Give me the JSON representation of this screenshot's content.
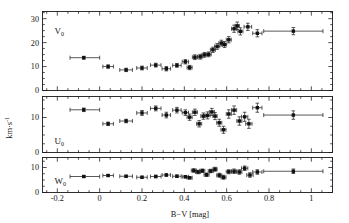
{
  "figure": {
    "width": 349,
    "height": 223,
    "background": "#ffffff",
    "ink_color": "#151515"
  },
  "axes": {
    "xlabel": "B−V [mag]",
    "ylabel": "km·s",
    "ylabel_exp": "-1",
    "x_ticklabels": [
      "-0.2",
      "0",
      "0.2",
      "0.4",
      "0.6",
      "0.8",
      "1"
    ],
    "x_tickvalues": [
      -0.2,
      0,
      0.2,
      0.4,
      0.6,
      0.8,
      1.0
    ],
    "xlim": [
      -0.27,
      1.1
    ],
    "x_minor_step": 0.05
  },
  "panels": [
    {
      "id": "panel-v",
      "label": "V",
      "label_sub": "0",
      "y_ticklabels": [
        "0",
        "10",
        "20",
        "30"
      ],
      "y_tickvalues": [
        0,
        10,
        20,
        30
      ],
      "ylim": [
        0,
        33
      ],
      "y_minor_step": 2.5
    },
    {
      "id": "panel-u",
      "label": "U",
      "label_sub": "0",
      "y_ticklabels": [
        "0",
        "10"
      ],
      "y_tickvalues": [
        0,
        10
      ],
      "ylim": [
        0,
        16
      ],
      "y_minor_step": 2.5
    },
    {
      "id": "panel-w",
      "label": "W",
      "label_sub": "0",
      "y_ticklabels": [
        "0",
        "10"
      ],
      "y_tickvalues": [
        0,
        10
      ],
      "ylim": [
        0,
        14
      ],
      "y_minor_step": 2.5
    }
  ],
  "chart_data": [
    {
      "type": "scatter",
      "title": "V0 velocity dispersion vs B-V",
      "panel": "panel-v",
      "xlabel": "B−V [mag]",
      "ylabel": "km·s^-1",
      "series_name": "V0",
      "xlim": [
        -0.27,
        1.1
      ],
      "ylim": [
        0,
        33
      ],
      "grid": false,
      "legend": "none",
      "points": [
        {
          "x": -0.075,
          "y": 13.7,
          "xerr_lo": 0.065,
          "xerr_hi": 0.075,
          "yerr": 0.6
        },
        {
          "x": 0.04,
          "y": 10.0,
          "xerr_lo": 0.025,
          "xerr_hi": 0.025,
          "yerr": 0.7
        },
        {
          "x": 0.125,
          "y": 8.6,
          "xerr_lo": 0.03,
          "xerr_hi": 0.03,
          "yerr": 0.7
        },
        {
          "x": 0.2,
          "y": 9.4,
          "xerr_lo": 0.025,
          "xerr_hi": 0.025,
          "yerr": 0.8
        },
        {
          "x": 0.265,
          "y": 10.6,
          "xerr_lo": 0.025,
          "xerr_hi": 0.025,
          "yerr": 0.8
        },
        {
          "x": 0.315,
          "y": 9.1,
          "xerr_lo": 0.02,
          "xerr_hi": 0.02,
          "yerr": 0.9
        },
        {
          "x": 0.365,
          "y": 10.5,
          "xerr_lo": 0.02,
          "xerr_hi": 0.02,
          "yerr": 0.8
        },
        {
          "x": 0.405,
          "y": 12.0,
          "xerr_lo": 0.015,
          "xerr_hi": 0.015,
          "yerr": 0.9
        },
        {
          "x": 0.425,
          "y": 9.6,
          "xerr_lo": 0.012,
          "xerr_hi": 0.012,
          "yerr": 0.9
        },
        {
          "x": 0.45,
          "y": 13.9,
          "xerr_lo": 0.012,
          "xerr_hi": 0.012,
          "yerr": 1.0
        },
        {
          "x": 0.475,
          "y": 14.1,
          "xerr_lo": 0.012,
          "xerr_hi": 0.012,
          "yerr": 1.0
        },
        {
          "x": 0.495,
          "y": 14.9,
          "xerr_lo": 0.012,
          "xerr_hi": 0.012,
          "yerr": 1.0
        },
        {
          "x": 0.515,
          "y": 15.1,
          "xerr_lo": 0.012,
          "xerr_hi": 0.012,
          "yerr": 1.0
        },
        {
          "x": 0.535,
          "y": 17.0,
          "xerr_lo": 0.012,
          "xerr_hi": 0.012,
          "yerr": 1.1
        },
        {
          "x": 0.555,
          "y": 18.4,
          "xerr_lo": 0.012,
          "xerr_hi": 0.012,
          "yerr": 1.2
        },
        {
          "x": 0.575,
          "y": 19.8,
          "xerr_lo": 0.012,
          "xerr_hi": 0.012,
          "yerr": 1.2
        },
        {
          "x": 0.59,
          "y": 19.2,
          "xerr_lo": 0.01,
          "xerr_hi": 0.01,
          "yerr": 1.2
        },
        {
          "x": 0.61,
          "y": 21.2,
          "xerr_lo": 0.012,
          "xerr_hi": 0.012,
          "yerr": 1.3
        },
        {
          "x": 0.635,
          "y": 25.8,
          "xerr_lo": 0.012,
          "xerr_hi": 0.012,
          "yerr": 1.5
        },
        {
          "x": 0.65,
          "y": 27.0,
          "xerr_lo": 0.01,
          "xerr_hi": 0.01,
          "yerr": 1.6
        },
        {
          "x": 0.665,
          "y": 24.7,
          "xerr_lo": 0.012,
          "xerr_hi": 0.012,
          "yerr": 1.5
        },
        {
          "x": 0.7,
          "y": 26.6,
          "xerr_lo": 0.018,
          "xerr_hi": 0.018,
          "yerr": 1.5
        },
        {
          "x": 0.745,
          "y": 23.9,
          "xerr_lo": 0.022,
          "xerr_hi": 0.022,
          "yerr": 1.5
        },
        {
          "x": 0.915,
          "y": 24.8,
          "xerr_lo": 0.14,
          "xerr_hi": 0.14,
          "yerr": 1.5
        }
      ]
    },
    {
      "type": "scatter",
      "title": "U0 velocity dispersion vs B-V",
      "panel": "panel-u",
      "xlabel": "B−V [mag]",
      "ylabel": "km·s^-1",
      "series_name": "U0",
      "xlim": [
        -0.27,
        1.1
      ],
      "ylim": [
        0,
        16
      ],
      "grid": false,
      "legend": "none",
      "points": [
        {
          "x": -0.075,
          "y": 12.2,
          "xerr_lo": 0.065,
          "xerr_hi": 0.075,
          "yerr": 0.5
        },
        {
          "x": 0.04,
          "y": 8.2,
          "xerr_lo": 0.025,
          "xerr_hi": 0.025,
          "yerr": 0.5
        },
        {
          "x": 0.125,
          "y": 9.0,
          "xerr_lo": 0.03,
          "xerr_hi": 0.03,
          "yerr": 0.5
        },
        {
          "x": 0.2,
          "y": 11.3,
          "xerr_lo": 0.025,
          "xerr_hi": 0.025,
          "yerr": 0.7
        },
        {
          "x": 0.265,
          "y": 12.6,
          "xerr_lo": 0.025,
          "xerr_hi": 0.025,
          "yerr": 0.7
        },
        {
          "x": 0.315,
          "y": 10.7,
          "xerr_lo": 0.02,
          "xerr_hi": 0.02,
          "yerr": 0.8
        },
        {
          "x": 0.365,
          "y": 12.1,
          "xerr_lo": 0.02,
          "xerr_hi": 0.02,
          "yerr": 0.8
        },
        {
          "x": 0.405,
          "y": 11.4,
          "xerr_lo": 0.015,
          "xerr_hi": 0.015,
          "yerr": 0.8
        },
        {
          "x": 0.425,
          "y": 10.1,
          "xerr_lo": 0.012,
          "xerr_hi": 0.012,
          "yerr": 0.9
        },
        {
          "x": 0.45,
          "y": 11.5,
          "xerr_lo": 0.012,
          "xerr_hi": 0.012,
          "yerr": 0.9
        },
        {
          "x": 0.47,
          "y": 8.2,
          "xerr_lo": 0.012,
          "xerr_hi": 0.012,
          "yerr": 0.9
        },
        {
          "x": 0.49,
          "y": 10.4,
          "xerr_lo": 0.012,
          "xerr_hi": 0.012,
          "yerr": 0.9
        },
        {
          "x": 0.51,
          "y": 10.6,
          "xerr_lo": 0.012,
          "xerr_hi": 0.012,
          "yerr": 1.0
        },
        {
          "x": 0.53,
          "y": 11.6,
          "xerr_lo": 0.012,
          "xerr_hi": 0.012,
          "yerr": 1.0
        },
        {
          "x": 0.545,
          "y": 10.4,
          "xerr_lo": 0.01,
          "xerr_hi": 0.01,
          "yerr": 1.0
        },
        {
          "x": 0.565,
          "y": 8.5,
          "xerr_lo": 0.012,
          "xerr_hi": 0.012,
          "yerr": 1.0
        },
        {
          "x": 0.585,
          "y": 6.5,
          "xerr_lo": 0.012,
          "xerr_hi": 0.012,
          "yerr": 1.0
        },
        {
          "x": 0.61,
          "y": 11.0,
          "xerr_lo": 0.012,
          "xerr_hi": 0.012,
          "yerr": 1.2
        },
        {
          "x": 0.635,
          "y": 12.1,
          "xerr_lo": 0.012,
          "xerr_hi": 0.012,
          "yerr": 1.2
        },
        {
          "x": 0.66,
          "y": 9.0,
          "xerr_lo": 0.012,
          "xerr_hi": 0.012,
          "yerr": 1.2
        },
        {
          "x": 0.685,
          "y": 10.2,
          "xerr_lo": 0.015,
          "xerr_hi": 0.015,
          "yerr": 1.3
        },
        {
          "x": 0.705,
          "y": 8.2,
          "xerr_lo": 0.015,
          "xerr_hi": 0.015,
          "yerr": 1.3
        },
        {
          "x": 0.745,
          "y": 12.8,
          "xerr_lo": 0.022,
          "xerr_hi": 0.022,
          "yerr": 1.3
        },
        {
          "x": 0.915,
          "y": 10.7,
          "xerr_lo": 0.14,
          "xerr_hi": 0.14,
          "yerr": 1.2
        }
      ]
    },
    {
      "type": "scatter",
      "title": "W0 velocity dispersion vs B-V",
      "panel": "panel-w",
      "xlabel": "B−V [mag]",
      "ylabel": "km·s^-1",
      "series_name": "W0",
      "xlim": [
        -0.27,
        1.1
      ],
      "ylim": [
        0,
        14
      ],
      "grid": false,
      "legend": "none",
      "points": [
        {
          "x": -0.075,
          "y": 6.4,
          "xerr_lo": 0.065,
          "xerr_hi": 0.075,
          "yerr": 0.4
        },
        {
          "x": 0.04,
          "y": 6.8,
          "xerr_lo": 0.025,
          "xerr_hi": 0.025,
          "yerr": 0.4
        },
        {
          "x": 0.125,
          "y": 6.5,
          "xerr_lo": 0.03,
          "xerr_hi": 0.03,
          "yerr": 0.4
        },
        {
          "x": 0.2,
          "y": 6.1,
          "xerr_lo": 0.025,
          "xerr_hi": 0.025,
          "yerr": 0.4
        },
        {
          "x": 0.265,
          "y": 6.4,
          "xerr_lo": 0.025,
          "xerr_hi": 0.025,
          "yerr": 0.5
        },
        {
          "x": 0.315,
          "y": 7.0,
          "xerr_lo": 0.02,
          "xerr_hi": 0.02,
          "yerr": 0.5
        },
        {
          "x": 0.365,
          "y": 6.5,
          "xerr_lo": 0.02,
          "xerr_hi": 0.02,
          "yerr": 0.5
        },
        {
          "x": 0.405,
          "y": 6.3,
          "xerr_lo": 0.015,
          "xerr_hi": 0.015,
          "yerr": 0.5
        },
        {
          "x": 0.425,
          "y": 5.9,
          "xerr_lo": 0.012,
          "xerr_hi": 0.012,
          "yerr": 0.5
        },
        {
          "x": 0.445,
          "y": 8.8,
          "xerr_lo": 0.012,
          "xerr_hi": 0.012,
          "yerr": 0.7
        },
        {
          "x": 0.465,
          "y": 8.2,
          "xerr_lo": 0.012,
          "xerr_hi": 0.012,
          "yerr": 0.7
        },
        {
          "x": 0.485,
          "y": 8.7,
          "xerr_lo": 0.012,
          "xerr_hi": 0.012,
          "yerr": 0.7
        },
        {
          "x": 0.505,
          "y": 7.1,
          "xerr_lo": 0.012,
          "xerr_hi": 0.012,
          "yerr": 0.7
        },
        {
          "x": 0.525,
          "y": 8.6,
          "xerr_lo": 0.012,
          "xerr_hi": 0.012,
          "yerr": 0.7
        },
        {
          "x": 0.545,
          "y": 9.3,
          "xerr_lo": 0.01,
          "xerr_hi": 0.01,
          "yerr": 0.8
        },
        {
          "x": 0.565,
          "y": 6.9,
          "xerr_lo": 0.012,
          "xerr_hi": 0.012,
          "yerr": 0.8
        },
        {
          "x": 0.585,
          "y": 6.1,
          "xerr_lo": 0.012,
          "xerr_hi": 0.012,
          "yerr": 0.8
        },
        {
          "x": 0.61,
          "y": 8.3,
          "xerr_lo": 0.012,
          "xerr_hi": 0.012,
          "yerr": 0.8
        },
        {
          "x": 0.635,
          "y": 8.5,
          "xerr_lo": 0.012,
          "xerr_hi": 0.012,
          "yerr": 0.9
        },
        {
          "x": 0.66,
          "y": 8.2,
          "xerr_lo": 0.012,
          "xerr_hi": 0.012,
          "yerr": 0.9
        },
        {
          "x": 0.685,
          "y": 9.7,
          "xerr_lo": 0.015,
          "xerr_hi": 0.015,
          "yerr": 0.9
        },
        {
          "x": 0.71,
          "y": 7.0,
          "xerr_lo": 0.015,
          "xerr_hi": 0.015,
          "yerr": 0.9
        },
        {
          "x": 0.745,
          "y": 8.2,
          "xerr_lo": 0.022,
          "xerr_hi": 0.022,
          "yerr": 0.9
        },
        {
          "x": 0.915,
          "y": 8.5,
          "xerr_lo": 0.14,
          "xerr_hi": 0.14,
          "yerr": 0.9
        }
      ]
    }
  ]
}
